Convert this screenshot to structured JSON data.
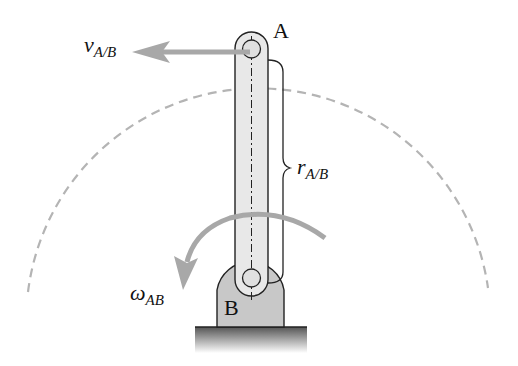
{
  "diagram": {
    "labels": {
      "point_a": "A",
      "point_b": "B",
      "velocity_symbol": "v",
      "velocity_sub": "A/B",
      "position_symbol": "r",
      "position_sub": "A/B",
      "omega_symbol": "ω",
      "omega_sub": "AB"
    },
    "colors": {
      "link_fill": "#e8e8e8",
      "support_fill": "#c8c8c8",
      "arrow_gray": "#a8a8a8",
      "dashed_path": "#b4b4b4",
      "outline": "#222222"
    }
  }
}
